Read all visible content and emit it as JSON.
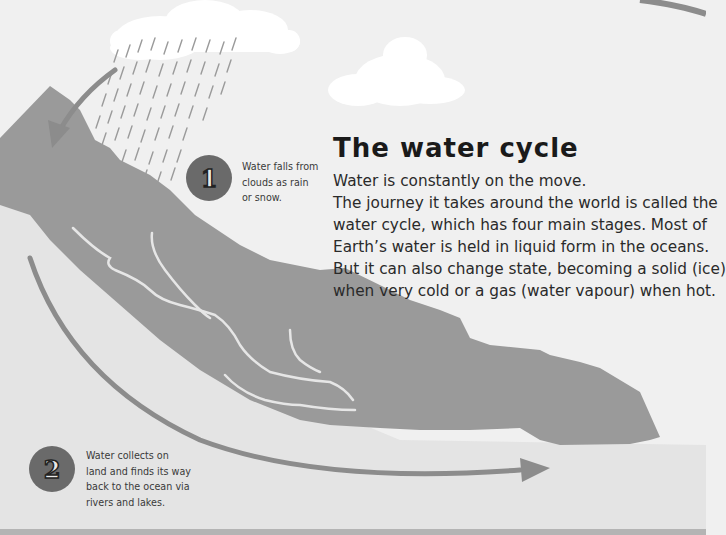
{
  "page": {
    "title": "The water cycle",
    "intro_lines": [
      "Water is constantly on the move.",
      "The journey it takes around the world is called the",
      "water cycle, which has four main stages. Most of",
      "Earth’s water is held in liquid form in the oceans.",
      "But it can also change state, becoming a solid (ice)",
      "when very cold or a gas (water vapour) when hot."
    ]
  },
  "steps": [
    {
      "number": "1",
      "caption_lines": [
        "Water falls from",
        "clouds as rain",
        "or snow."
      ]
    },
    {
      "number": "2",
      "caption_lines": [
        "Water collects on",
        "land and finds its way",
        "back to the ocean via",
        "rivers and lakes."
      ]
    }
  ],
  "illustration": {
    "elements": [
      "rain-cloud",
      "cloud",
      "mountain",
      "rivers",
      "rain",
      "ocean",
      "cycle-arrows"
    ],
    "colors": {
      "sky": "#f0f0f0",
      "cloud": "#ffffff",
      "mountain": "#9a9a9a",
      "river": "#e6e6e6",
      "ocean": "#e4e4e4",
      "arrow": "#8c8c8c",
      "badge": "#6a6a6a"
    }
  }
}
